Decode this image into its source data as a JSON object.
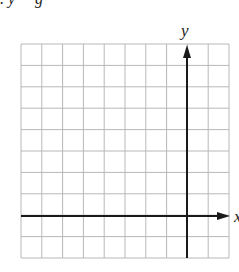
{
  "clipped_top_text": ". y     g",
  "grid": {
    "left": 21,
    "top": 44,
    "right": 229,
    "bottom": 258,
    "cols": 10,
    "rows": 10,
    "line_color": "#b8b8b8"
  },
  "axes": {
    "color": "#1a1a1a",
    "y_axis": {
      "label": "y",
      "column_index": 8
    },
    "x_axis": {
      "label": "x",
      "row_index": 8
    }
  }
}
